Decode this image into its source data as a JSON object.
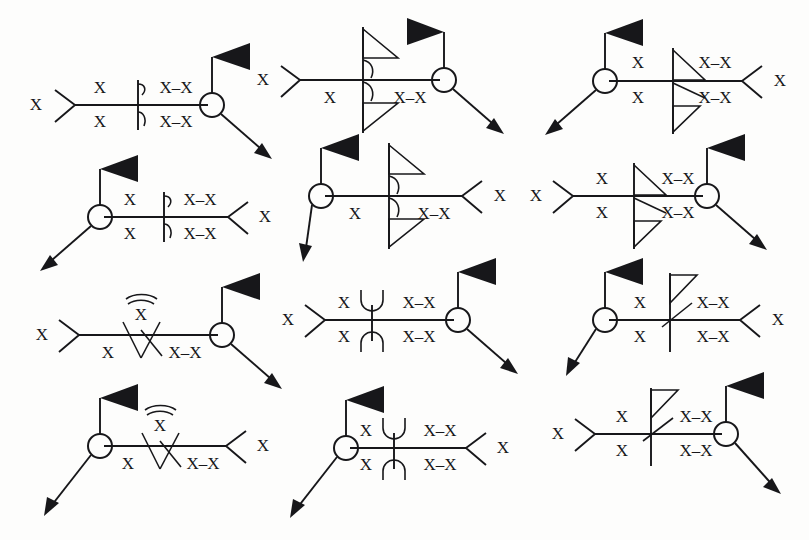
{
  "page": {
    "background_color": "#fdfdfc",
    "ink_color": "#17171a",
    "width": 809,
    "height": 540,
    "columns": 3,
    "rows": 4,
    "diagram_count": 12
  },
  "legend": {
    "token_x": "X",
    "token_x_dash_x": "X–X",
    "token_x_bar": "X"
  },
  "diagrams": [
    {
      "id": "d1",
      "position": "row1-col1",
      "center_glyph": "half-barb-pair",
      "node_side": "right",
      "tail_side": "left",
      "flag": "solid-pennant-up-right",
      "arrow": "down-right",
      "labels": {
        "upper_left": "X",
        "upper_right": "X–X",
        "lower_left": "X",
        "lower_right": "X–X",
        "tail": "X"
      }
    },
    {
      "id": "d2",
      "position": "row1-col2",
      "center_glyph": "open-triangle-pair-with-arcs",
      "node_side": "right",
      "tail_side": "left",
      "flag": "solid-pennant-up-right",
      "arrow": "down-right",
      "labels": {
        "upper_left": "",
        "upper_right": "",
        "lower_left": "X",
        "lower_right": "X–X",
        "tail": "X"
      }
    },
    {
      "id": "d3",
      "position": "row1-col3",
      "center_glyph": "full-barb-with-open-triangle",
      "node_side": "left",
      "tail_side": "right",
      "flag": "solid-pennant-up-right",
      "arrow": "down-left",
      "labels": {
        "upper_left": "X",
        "upper_right": "X–X",
        "lower_left": "X",
        "lower_right": "X–X",
        "tail": "X"
      }
    },
    {
      "id": "d4",
      "position": "row2-col1",
      "center_glyph": "half-barb-pair",
      "node_side": "left",
      "tail_side": "right",
      "flag": "solid-pennant-up-right",
      "arrow": "down-left",
      "labels": {
        "upper_left": "X",
        "upper_right": "X–X",
        "lower_left": "X",
        "lower_right": "X–X",
        "tail": "X"
      }
    },
    {
      "id": "d5",
      "position": "row2-col2",
      "center_glyph": "open-triangle-pair-with-arcs",
      "node_side": "left",
      "tail_side": "right",
      "flag": "solid-pennant-up-right",
      "arrow": "down-left",
      "labels": {
        "upper_left": "",
        "upper_right": "",
        "lower_left": "X",
        "lower_right": "X–X",
        "tail": "X"
      }
    },
    {
      "id": "d6",
      "position": "row2-col3",
      "center_glyph": "full-barb-with-open-triangle",
      "node_side": "right",
      "tail_side": "left",
      "flag": "solid-pennant-up-right",
      "arrow": "down-right",
      "labels": {
        "upper_left": "X",
        "upper_right": "X–X",
        "lower_left": "X",
        "lower_right": "X–X",
        "tail": "X"
      }
    },
    {
      "id": "d7",
      "position": "row3-col1",
      "center_glyph": "double-arc-over-xbar",
      "node_side": "right",
      "tail_side": "left",
      "flag": "solid-pennant-up-right",
      "arrow": "down-right",
      "labels": {
        "above": "X",
        "lower_left": "X",
        "lower_right": "X–X",
        "tail": "X"
      }
    },
    {
      "id": "d8",
      "position": "row3-col2",
      "center_glyph": "cup-pair",
      "node_side": "right",
      "tail_side": "left",
      "flag": "solid-pennant-up-right",
      "arrow": "down-right",
      "labels": {
        "upper_left": "X",
        "upper_right": "X–X",
        "lower_left": "X",
        "lower_right": "X–X",
        "tail": "X"
      }
    },
    {
      "id": "d9",
      "position": "row3-col3",
      "center_glyph": "open-triangle-with-slash",
      "node_side": "left",
      "tail_side": "right",
      "flag": "solid-pennant-up-right",
      "arrow": "down-left",
      "labels": {
        "upper_left": "X",
        "upper_right": "X–X",
        "lower_left": "X",
        "lower_right": "X–X",
        "tail": "X"
      }
    },
    {
      "id": "d10",
      "position": "row4-col1",
      "center_glyph": "double-arc-over-xbar",
      "node_side": "left",
      "tail_side": "right",
      "flag": "solid-pennant-up-right",
      "arrow": "down-left",
      "labels": {
        "above": "X",
        "lower_left": "X",
        "lower_right": "X–X",
        "tail": "X"
      }
    },
    {
      "id": "d11",
      "position": "row4-col2",
      "center_glyph": "cup-pair",
      "node_side": "left",
      "tail_side": "right",
      "flag": "solid-pennant-up-right",
      "arrow": "down-left",
      "labels": {
        "upper_left": "X",
        "upper_right": "X–X",
        "lower_left": "X",
        "lower_right": "X–X",
        "tail": "X"
      }
    },
    {
      "id": "d12",
      "position": "row4-col3",
      "center_glyph": "open-triangle-with-slash",
      "node_side": "right",
      "tail_side": "left",
      "flag": "solid-pennant-up-right",
      "arrow": "down-right",
      "labels": {
        "upper_left": "X",
        "upper_right": "X–X",
        "lower_left": "X",
        "lower_right": "X–X",
        "tail": "X"
      }
    }
  ]
}
